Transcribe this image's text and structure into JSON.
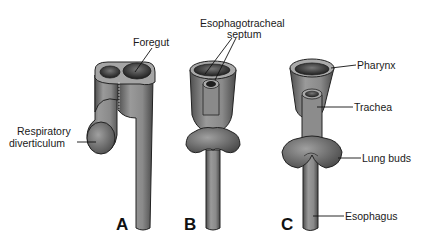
{
  "figure": {
    "panels": [
      {
        "letter": "A",
        "labels": {
          "foregut": "Foregut",
          "respiratory_line1": "Respiratory",
          "respiratory_line2": "diverticulum"
        }
      },
      {
        "letter": "B",
        "labels": {
          "septum_line1": "Esophagotracheal",
          "septum_line2": "septum"
        }
      },
      {
        "letter": "C",
        "labels": {
          "pharynx": "Pharynx",
          "trachea": "Trachea",
          "lung_buds": "Lung buds",
          "esophagus": "Esophagus"
        }
      }
    ],
    "colors": {
      "tissue": "#8a8a8a",
      "tissue_dark": "#4a4a4a",
      "tissue_light": "#b5b5b5",
      "outline": "#222222",
      "text": "#1a1a1a"
    }
  }
}
